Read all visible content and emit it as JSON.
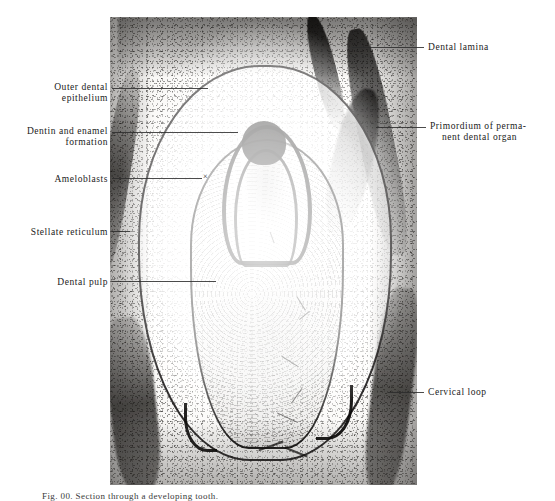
{
  "figure": {
    "kind": "histological-micrograph",
    "caption": "Fig. 00.  Section through a developing tooth.",
    "plate": {
      "x": 110,
      "y": 17,
      "width": 307,
      "height": 468,
      "tone_light": "#f4f3f1",
      "tone_dark": "#141312"
    }
  },
  "labels": {
    "left": [
      {
        "name": "outer-dental-epithelium",
        "line1": "Outer dental",
        "line2": "epithelium",
        "text_right_px": 108,
        "text_top_px": 82,
        "leader_x": 112,
        "leader_w": 96,
        "leader_y": 88
      },
      {
        "name": "dentin-and-enamel-formation",
        "line1": "Dentin and enamel",
        "line2": "formation",
        "text_right_px": 108,
        "text_top_px": 126,
        "leader_x": 112,
        "leader_w": 126,
        "leader_y": 132
      },
      {
        "name": "ameloblasts",
        "line1": "Ameloblasts",
        "line2": "",
        "text_right_px": 108,
        "text_top_px": 174,
        "leader_x": 112,
        "leader_w": 92,
        "leader_y": 178
      },
      {
        "name": "stellate-reticulum",
        "line1": "Stellate reticulum",
        "line2": "",
        "text_right_px": 108,
        "text_top_px": 227,
        "leader_x": 112,
        "leader_w": 18,
        "leader_y": 231
      },
      {
        "name": "dental-pulp",
        "line1": "Dental pulp",
        "line2": "",
        "text_right_px": 108,
        "text_top_px": 277,
        "leader_x": 112,
        "leader_w": 104,
        "leader_y": 281
      }
    ],
    "right": [
      {
        "name": "dental-lamina",
        "line1": "Dental lamina",
        "line2": "",
        "text_left_px": 428,
        "text_top_px": 42,
        "leader_x": 352,
        "leader_w": 72,
        "leader_y": 47
      },
      {
        "name": "primordium-of-permanent-dental-organ",
        "line1": "Primordium of perma-",
        "line2": "nent dental organ",
        "text_left_px": 430,
        "text_top_px": 121,
        "leader_x": 376,
        "leader_w": 50,
        "leader_y": 127
      },
      {
        "name": "cervical-loop",
        "line1": "Cervical loop",
        "line2": "",
        "text_left_px": 428,
        "text_top_px": 387,
        "leader_x": 388,
        "leader_w": 36,
        "leader_y": 392
      }
    ]
  },
  "marks": {
    "ameloblast_pointer": {
      "glyph": "×",
      "x": 203,
      "y": 172
    }
  }
}
